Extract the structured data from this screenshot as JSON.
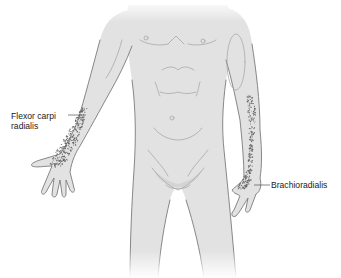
{
  "figure": {
    "labels": [
      {
        "id": "flexor-carpi-radialis",
        "line1": "Flexor carpi",
        "line2": "radialis"
      },
      {
        "id": "brachioradialis",
        "line1": "Brachioradialis"
      }
    ],
    "colors": {
      "skin": "#e2e2e2",
      "outline": "#7a7a7a",
      "stipple": "#666666",
      "text": "#222222",
      "background": "#ffffff"
    }
  }
}
